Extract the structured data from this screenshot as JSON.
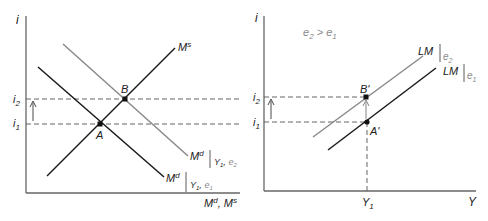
{
  "left_panel": {
    "y_axis_label": "i",
    "x_axis_label": "Mᵈ, Mˢ",
    "x_axis_label_parts": {
      "base1": "M",
      "sup1": "d",
      "sep": ", ",
      "base2": "M",
      "sup2": "s"
    },
    "ticks": {
      "i2": {
        "base": "i",
        "sub": "2"
      },
      "i1": {
        "base": "i",
        "sub": "1"
      }
    },
    "points": {
      "A": "A",
      "B": "B"
    },
    "curves": {
      "money_supply": {
        "base": "M",
        "sup": "s"
      },
      "money_demand_e1": {
        "base": "M",
        "sup": "d",
        "cond": "Y",
        "cond_sub": "1",
        "sep": ", ",
        "param": "e",
        "param_sub": "1"
      },
      "money_demand_e2": {
        "base": "M",
        "sup": "d",
        "cond": "Y",
        "cond_sub": "1",
        "sep": ", ",
        "param": "e",
        "param_sub": "2"
      }
    }
  },
  "right_panel": {
    "y_axis_label": "i",
    "x_axis_label": "Y",
    "annotation": {
      "a": "e",
      "a_sub": "2",
      "op": " > ",
      "b": "e",
      "b_sub": "1"
    },
    "ticks": {
      "i2": {
        "base": "i",
        "sub": "2"
      },
      "i1": {
        "base": "i",
        "sub": "1"
      },
      "Y1": {
        "base": "Y",
        "sub": "1"
      }
    },
    "points": {
      "A_prime": "A'",
      "B_prime": "B'"
    },
    "curves": {
      "lm_e2": {
        "base": "LM",
        "param": "e",
        "param_sub": "2"
      },
      "lm_e1": {
        "base": "LM",
        "param": "e",
        "param_sub": "1"
      }
    }
  },
  "colors": {
    "axis": "#555555",
    "black_curve": "#1a1a1a",
    "gray_curve": "#8a8a8a",
    "dashed": "#555555",
    "point": "#111111"
  }
}
